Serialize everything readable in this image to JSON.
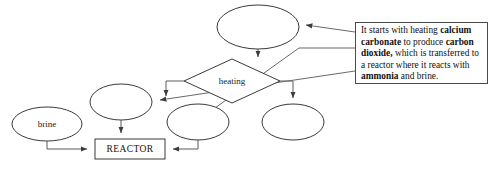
{
  "diagram": {
    "background_color": "#ffffff",
    "stroke_color": "#3a3a3a",
    "connector_color": "#5a5a5a",
    "nodes": [
      {
        "id": "top-ellipse",
        "shape": "ellipse",
        "label": "",
        "cx": 258,
        "cy": 27,
        "rx": 41,
        "ry": 22
      },
      {
        "id": "heating-diamond",
        "shape": "diamond",
        "label": "heating",
        "cx": 232,
        "cy": 81,
        "rx": 48,
        "ry": 22
      },
      {
        "id": "left-mid-ellipse",
        "shape": "ellipse",
        "label": "",
        "cx": 121,
        "cy": 102,
        "rx": 31,
        "ry": 18
      },
      {
        "id": "center-low-ellipse",
        "shape": "ellipse",
        "label": "",
        "cx": 198,
        "cy": 122,
        "rx": 31,
        "ry": 18
      },
      {
        "id": "right-low-ellipse",
        "shape": "ellipse",
        "label": "",
        "cx": 293,
        "cy": 122,
        "rx": 31,
        "ry": 18
      },
      {
        "id": "brine-ellipse",
        "shape": "ellipse",
        "label": "brine",
        "cx": 47,
        "cy": 124,
        "rx": 35,
        "ry": 17
      },
      {
        "id": "reactor-box",
        "shape": "rect",
        "label": "REACTOR",
        "x": 95,
        "y": 139,
        "w": 70,
        "h": 20
      }
    ]
  },
  "note": {
    "id": "annotation-note",
    "segments": [
      {
        "text": "It starts with heating ",
        "bold": false
      },
      {
        "text": "calcium carbonate",
        "bold": true
      },
      {
        "text": " to produce ",
        "bold": false
      },
      {
        "text": "carbon dioxide,",
        "bold": true
      },
      {
        "text": " which is transferred to a reactor where it reacts with ",
        "bold": false
      },
      {
        "text": "ammonia",
        "bold": true
      },
      {
        "text": " and brine.",
        "bold": false
      }
    ],
    "plain_text": "It starts with heating calcium carbonate to produce carbon dioxide, which is transferred to a reactor where it reacts with ammonia and brine."
  }
}
